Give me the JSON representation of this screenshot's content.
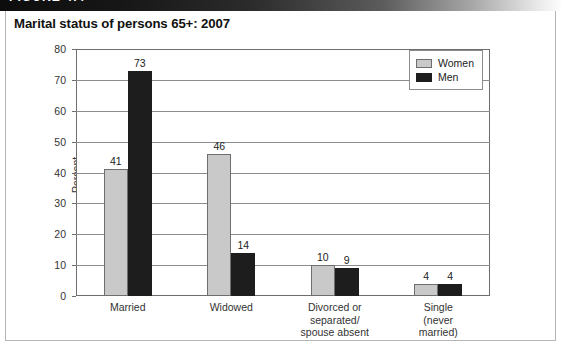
{
  "figure": {
    "banner_label": "FIGURE 4.4",
    "title": "Marital status of persons 65+: 2007"
  },
  "legend": {
    "position": "top-right",
    "entries": [
      {
        "label": "Women",
        "color": "#c9c9c9"
      },
      {
        "label": "Men",
        "color": "#1d1d1d"
      }
    ]
  },
  "axes": {
    "ylabel": "Percent",
    "yticks": [
      "0",
      "10",
      "20",
      "30",
      "40",
      "50",
      "60",
      "70",
      "80"
    ],
    "ymin": 0,
    "ymax": 80
  },
  "chart_data": {
    "type": "bar",
    "title": "Marital status of persons 65+: 2007",
    "xlabel": "",
    "ylabel": "Percent",
    "ylim": [
      0,
      80
    ],
    "ytick_step": 10,
    "grid": true,
    "legend_position": "top-right",
    "categories": [
      "Married",
      "Widowed",
      "Divorced or separated/ spouse absent",
      "Single (never married)"
    ],
    "category_lines": [
      [
        "Married"
      ],
      [
        "Widowed"
      ],
      [
        "Divorced or",
        "separated/",
        "spouse absent"
      ],
      [
        "Single",
        "(never",
        "married)"
      ]
    ],
    "series": [
      {
        "name": "Women",
        "color": "#c9c9c9",
        "values": [
          41,
          46,
          10,
          4
        ]
      },
      {
        "name": "Men",
        "color": "#1d1d1d",
        "values": [
          73,
          14,
          9,
          4
        ]
      }
    ]
  }
}
